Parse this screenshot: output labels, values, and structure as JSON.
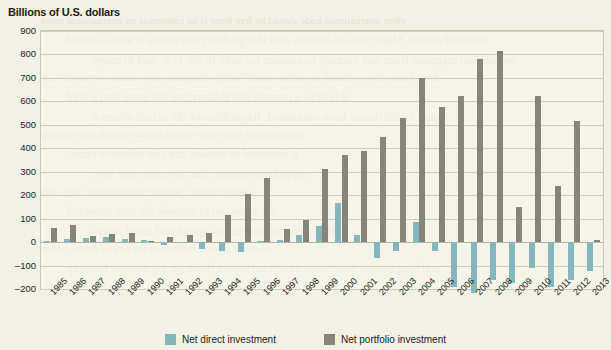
{
  "title": "Billions of U.S. dollars",
  "colors": {
    "direct": "#86b6bd",
    "portfolio": "#85857b",
    "background": "#f2f1e6",
    "grid": "#cfcdba",
    "text": "#1d1d1b"
  },
  "legend": {
    "direct_label": "Net direct investment",
    "portfolio_label": "Net portfolio investment"
  },
  "bleed_lines": [
    "ether international trade should be free there is no consensus on international move",
    "ments of capital. Major roots of concern over this go direct investment is now so compl",
    "production migrates from one country to another for both in the U.S. and in many",
    "firms have set up a branch in another where foreign companies have taken over in the U.S.",
    "It is to be a concern that industry has lost more than a third",
    "and credit drains have continued. Regardless of the actual absence",
    "the profits of their work should remain in their own country",
    "it happened or markets can also influence public",
    "capital movements that are also very very",
    "needed capital, whether short-term or long-term",
    "are important to describe the total impact of",
    "those an investment in current and fixed assets",
    "the most general features of the largest debtor nation",
    "and long-term or short-term significant capital flows for the investor behavior"
  ],
  "chart_data": {
    "type": "bar",
    "title": "Billions of U.S. dollars",
    "xlabel": "",
    "ylabel": "Billions of U.S. dollars",
    "ylim": [
      -200,
      900
    ],
    "ytick_step": 100,
    "yticks": [
      900,
      800,
      700,
      600,
      500,
      400,
      300,
      200,
      100,
      0,
      -100,
      -200
    ],
    "grid": true,
    "legend_position": "bottom",
    "categories": [
      "1985",
      "1986",
      "1987",
      "1988",
      "1989",
      "1990",
      "1991",
      "1992",
      "1993",
      "1994",
      "1995",
      "1996",
      "1997",
      "1998",
      "1999",
      "2000",
      "2001",
      "2002",
      "2003",
      "2004",
      "2005",
      "2006",
      "2007",
      "2008",
      "2009",
      "2010",
      "2011",
      "2012",
      "2013"
    ],
    "series": [
      {
        "name": "Net direct investment",
        "color": "#86b6bd",
        "values": [
          5,
          12,
          18,
          20,
          15,
          8,
          -12,
          2,
          -30,
          -40,
          -42,
          5,
          8,
          30,
          70,
          165,
          30,
          -70,
          -40,
          85,
          -40,
          -190,
          -215,
          -160,
          -175,
          -110,
          -190,
          -160,
          -125
        ]
      },
      {
        "name": "Net portfolio investment",
        "color": "#85857b",
        "values": [
          60,
          72,
          28,
          35,
          38,
          5,
          20,
          32,
          40,
          115,
          205,
          275,
          55,
          95,
          310,
          370,
          390,
          450,
          530,
          700,
          575,
          625,
          780,
          815,
          150,
          625,
          240,
          515,
          10
        ]
      }
    ]
  }
}
